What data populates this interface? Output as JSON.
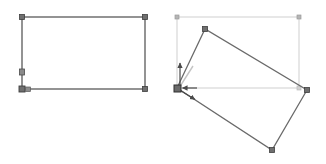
{
  "canvas": {
    "width": 326,
    "height": 164,
    "background": "#ffffff",
    "title": "Rectangle rotation illustration"
  },
  "colors": {
    "shape_stroke": "#5a5a5a",
    "shape_stroke_light": "#7d7d7d",
    "bbox_stroke": "#cfcfcf",
    "handle_fill": "#6f6f6f",
    "handle_stroke": "#3f3f3f",
    "bbox_handle_fill": "#b5b5b5",
    "arrow_fill": "#4a4a4a",
    "guide_stroke": "#bdbdbd",
    "background": "#ffffff"
  },
  "figures": [
    {
      "id": "left-figure",
      "name": "axis-aligned-rectangle",
      "label": "",
      "shape": {
        "type": "rectangle",
        "rotation_deg": 0,
        "corners": [
          {
            "name": "top-left",
            "x": 22,
            "y": 17
          },
          {
            "name": "top-right",
            "x": 145,
            "y": 17
          },
          {
            "name": "bottom-right",
            "x": 145,
            "y": 89
          },
          {
            "name": "bottom-left",
            "x": 22,
            "y": 89
          }
        ],
        "width": 123,
        "height": 72
      },
      "handles": [
        {
          "name": "corner-handle-top-left",
          "x": 22,
          "y": 17,
          "size": 5
        },
        {
          "name": "corner-handle-top-right",
          "x": 145,
          "y": 17,
          "size": 5
        },
        {
          "name": "corner-handle-bottom-right",
          "x": 145,
          "y": 89,
          "size": 5
        },
        {
          "name": "corner-handle-bottom-left",
          "x": 22,
          "y": 89,
          "size": 6
        },
        {
          "name": "edge-handle-left",
          "x": 22,
          "y": 72,
          "size": 5
        },
        {
          "name": "anchor-handle-bottom-left",
          "x": 28,
          "y": 89,
          "size": 4
        }
      ]
    },
    {
      "id": "right-figure",
      "name": "rotated-rectangle",
      "label": "",
      "bounding_box": {
        "name": "selection-bounding-box",
        "x": 177,
        "y": 17,
        "width": 122,
        "height": 71,
        "stroke": "#cfcfcf",
        "handles": [
          {
            "name": "bbox-handle-top-left",
            "x": 177,
            "y": 17,
            "size": 4
          },
          {
            "name": "bbox-handle-top-right",
            "x": 299,
            "y": 17,
            "size": 4
          },
          {
            "name": "bbox-handle-bottom-right",
            "x": 299,
            "y": 88,
            "size": 4
          },
          {
            "name": "bbox-handle-bottom-left",
            "x": 177,
            "y": 88,
            "size": 4
          }
        ]
      },
      "shape": {
        "type": "rectangle",
        "rotation_deg": 30,
        "corners": [
          {
            "name": "pivot-corner",
            "x": 177,
            "y": 88
          },
          {
            "name": "top-corner",
            "x": 205,
            "y": 29
          },
          {
            "name": "right-corner",
            "x": 307,
            "y": 90
          },
          {
            "name": "bottom-corner",
            "x": 272,
            "y": 150
          }
        ]
      },
      "handles": [
        {
          "name": "corner-handle-pivot",
          "x": 177,
          "y": 88,
          "size": 7
        },
        {
          "name": "corner-handle-top",
          "x": 205,
          "y": 29,
          "size": 5
        },
        {
          "name": "corner-handle-right",
          "x": 307,
          "y": 90,
          "size": 5
        },
        {
          "name": "corner-handle-bottom",
          "x": 272,
          "y": 150,
          "size": 5
        }
      ],
      "annotations": [
        {
          "name": "arrow-up",
          "type": "arrow",
          "from": {
            "x": 180,
            "y": 86
          },
          "to": {
            "x": 180,
            "y": 62
          },
          "direction": "up"
        },
        {
          "name": "arrow-left",
          "type": "arrow",
          "from": {
            "x": 196,
            "y": 88
          },
          "to": {
            "x": 181,
            "y": 88
          },
          "direction": "left"
        },
        {
          "name": "arrow-down-right",
          "type": "arrow",
          "from": {
            "x": 178,
            "y": 89
          },
          "to": {
            "x": 196,
            "y": 100
          },
          "direction": "down-right"
        },
        {
          "name": "rotation-guide-line",
          "type": "line",
          "from": {
            "x": 179,
            "y": 88
          },
          "to": {
            "x": 193,
            "y": 66
          },
          "style": "light"
        }
      ]
    }
  ]
}
